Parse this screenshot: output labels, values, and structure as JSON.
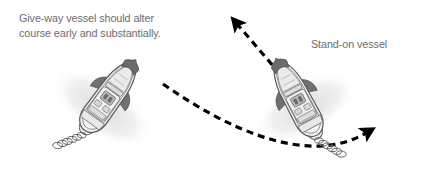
{
  "figure": {
    "name": "give-way-and-stand-on-vessel-crossing-diagram",
    "background_color": "#ffffff",
    "width": 421,
    "height": 174
  },
  "labels": {
    "giveway_caption_line1": "Give-way vessel should alter",
    "giveway_caption_line2": "course early and substantially.",
    "standon_caption": "Stand-on vessel",
    "text_color": "#6d6d6d"
  },
  "vessels": [
    {
      "id": "give-way-vessel",
      "role": "give-way",
      "position": {
        "x": 108,
        "y": 98
      },
      "heading_deg": 36,
      "hull_fill": "#f2f2f2",
      "outline_color": "#5a5a5a",
      "canopy_fill": "#6e6e6e",
      "shadow_color": "#e3e3e3",
      "has_prop_wake": true,
      "wake_direction": "astern-lower-left"
    },
    {
      "id": "stand-on-vessel",
      "role": "stand-on",
      "position": {
        "x": 298,
        "y": 100
      },
      "heading_deg": -28,
      "hull_fill": "#f2f2f2",
      "outline_color": "#5a5a5a",
      "canopy_fill": "#6e6e6e",
      "shadow_color": "#e3e3e3",
      "has_prop_wake": true,
      "wake_direction": "astern-lower-right"
    }
  ],
  "course_lines": [
    {
      "id": "stand-on-course-arrow",
      "style": "dashed",
      "color": "#000000",
      "stroke_width": 3.2,
      "dash": "7 5",
      "shape": "straight",
      "from": {
        "x": 278,
        "y": 72
      },
      "to": {
        "x": 236,
        "y": 22
      },
      "arrowhead": "end",
      "description": "Stand-on vessel maintains course and speed"
    },
    {
      "id": "give-way-course-arrow",
      "style": "dashed",
      "color": "#000000",
      "stroke_width": 3.2,
      "dash": "7 5",
      "shape": "curved",
      "from": {
        "x": 163,
        "y": 84
      },
      "control1": {
        "x": 232,
        "y": 132
      },
      "control2": {
        "x": 310,
        "y": 166
      },
      "to": {
        "x": 368,
        "y": 132
      },
      "arrowhead": "end",
      "description": "Give-way vessel turns to starboard and passes astern"
    }
  ]
}
